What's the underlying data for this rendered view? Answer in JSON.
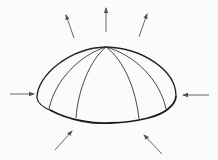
{
  "diagram": {
    "colors": {
      "background": "#fbfbf9",
      "outline": "#222222",
      "meridian": "#333333",
      "arrow": "#555555"
    },
    "dome": {
      "apex": [
        106,
        47
      ],
      "left_edge": [
        37,
        96
      ],
      "right_edge": [
        176,
        96
      ],
      "base_bottom": [
        106,
        123
      ],
      "meridian_base_points": [
        [
          49,
          109
        ],
        [
          76,
          118
        ],
        [
          139,
          119
        ],
        [
          166,
          109
        ]
      ]
    },
    "arrows": [
      {
        "id": "top-center",
        "from": [
          106,
          32
        ],
        "to": [
          106,
          8
        ]
      },
      {
        "id": "top-left",
        "from": [
          74,
          38
        ],
        "to": [
          66,
          15
        ]
      },
      {
        "id": "top-right",
        "from": [
          139,
          37
        ],
        "to": [
          147,
          14
        ]
      },
      {
        "id": "left",
        "from": [
          10,
          94
        ],
        "to": [
          34,
          94
        ]
      },
      {
        "id": "right",
        "from": [
          209,
          95
        ],
        "to": [
          183,
          95
        ]
      },
      {
        "id": "bottom-left",
        "from": [
          55,
          150
        ],
        "to": [
          72,
          131
        ]
      },
      {
        "id": "bottom-right",
        "from": [
          162,
          154
        ],
        "to": [
          144,
          135
        ]
      }
    ]
  }
}
